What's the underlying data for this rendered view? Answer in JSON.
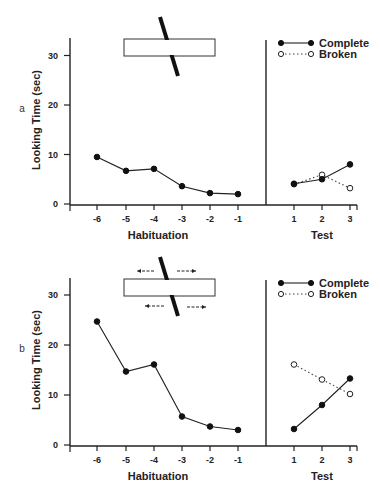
{
  "chart_data": [
    {
      "panel": "a",
      "type": "line",
      "ylabel": "Looking Time (sec)",
      "ylim": [
        0,
        33
      ],
      "yticks": [
        0,
        10,
        20,
        30
      ],
      "grid": false,
      "sections": [
        {
          "xlabel": "Habituation",
          "categories": [
            "-6",
            "-5",
            "-4",
            "-3",
            "-2",
            "-1"
          ],
          "series": [
            {
              "name": "Habituation",
              "marker": "filled",
              "line": "solid",
              "values": [
                9.5,
                6.7,
                7.1,
                3.6,
                2.2,
                2.0
              ]
            }
          ]
        },
        {
          "xlabel": "Test",
          "categories": [
            "1",
            "2",
            "3"
          ],
          "series": [
            {
              "name": "Complete",
              "marker": "filled",
              "line": "solid",
              "values": [
                4.1,
                5.0,
                8.0
              ]
            },
            {
              "name": "Broken",
              "marker": "open",
              "line": "dotted",
              "values": [
                4.0,
                5.9,
                3.2
              ]
            }
          ]
        }
      ],
      "legend": {
        "position": "top-right",
        "entries": [
          "Complete",
          "Broken"
        ]
      },
      "stimulus": "stationary rod occluded by box"
    },
    {
      "panel": "b",
      "type": "line",
      "ylabel": "Looking Time (sec)",
      "ylim": [
        0,
        33
      ],
      "yticks": [
        0,
        10,
        20,
        30
      ],
      "grid": false,
      "sections": [
        {
          "xlabel": "Habituation",
          "categories": [
            "-6",
            "-5",
            "-4",
            "-3",
            "-2",
            "-1"
          ],
          "series": [
            {
              "name": "Habituation",
              "marker": "filled",
              "line": "solid",
              "values": [
                24.7,
                14.7,
                16.1,
                5.7,
                3.7,
                3.0
              ]
            }
          ]
        },
        {
          "xlabel": "Test",
          "categories": [
            "1",
            "2",
            "3"
          ],
          "series": [
            {
              "name": "Complete",
              "marker": "filled",
              "line": "solid",
              "values": [
                3.2,
                8.0,
                13.3
              ]
            },
            {
              "name": "Broken",
              "marker": "open",
              "line": "dotted",
              "values": [
                16.1,
                13.1,
                10.2
              ]
            }
          ]
        }
      ],
      "legend": {
        "position": "top-right",
        "entries": [
          "Complete",
          "Broken"
        ]
      },
      "stimulus": "laterally moving rod occluded by box (arrows indicate motion)"
    }
  ],
  "labels": {
    "ylabel": "Looking Time (sec)",
    "habituation": "Habituation",
    "test": "Test",
    "panel_a": "a",
    "panel_b": "b",
    "legend_complete": "Complete",
    "legend_broken": "Broken"
  }
}
